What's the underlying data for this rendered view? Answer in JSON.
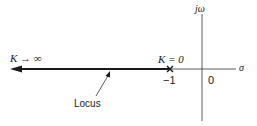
{
  "diagram": {
    "type": "root-locus",
    "axes": {
      "real_label": "σ",
      "imag_label": "jω",
      "origin_label": "0"
    },
    "pole": {
      "marker": "×",
      "position_label": "−1",
      "gain_label": "K = 0"
    },
    "locus": {
      "label": "Locus",
      "end_label": "K → ∞",
      "direction": "left"
    },
    "colors": {
      "line": "#1a1a1a",
      "axis": "#333333",
      "background": "#ffffff"
    }
  }
}
